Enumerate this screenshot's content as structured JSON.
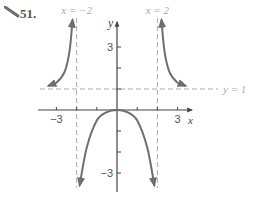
{
  "problem": {
    "number": "51."
  },
  "chart_data": {
    "type": "line",
    "title": "",
    "xlabel": "x",
    "ylabel": "y",
    "xlim": [
      -3.5,
      3.5
    ],
    "ylim": [
      -3.8,
      4.5
    ],
    "x_tick_labels": [
      {
        "value": -3,
        "label": "−3"
      },
      {
        "value": 3,
        "label": "3"
      }
    ],
    "y_tick_labels": [
      {
        "value": 3,
        "label": "3"
      },
      {
        "value": -3,
        "label": "−3"
      }
    ],
    "x_ticks": [
      -3,
      -2,
      -1,
      1,
      2,
      3
    ],
    "y_ticks": [
      -3,
      -2,
      -1,
      1,
      2,
      3
    ],
    "asymptotes": [
      {
        "type": "vertical",
        "value": -2,
        "label": "x = −2"
      },
      {
        "type": "vertical",
        "value": 2,
        "label": "x = 2"
      },
      {
        "type": "horizontal",
        "value": 1,
        "label": "y = 1"
      }
    ],
    "series": [
      {
        "name": "left-branch",
        "description": "above y=1, rising to +inf near x=-2 from left",
        "points": [
          [
            -3.4,
            1.15
          ],
          [
            -3,
            1.3
          ],
          [
            -2.6,
            1.8
          ],
          [
            -2.35,
            2.8
          ],
          [
            -2.2,
            4.3
          ]
        ]
      },
      {
        "name": "middle-branch",
        "description": "max at (0,0), falling to -inf near x=±2",
        "points": [
          [
            -1.85,
            -3.6
          ],
          [
            -1.5,
            -1.8
          ],
          [
            -1,
            -0.5
          ],
          [
            -0.5,
            -0.1
          ],
          [
            0,
            0
          ],
          [
            0.5,
            -0.1
          ],
          [
            1,
            -0.5
          ],
          [
            1.5,
            -1.8
          ],
          [
            1.85,
            -3.6
          ]
        ]
      },
      {
        "name": "right-branch",
        "description": "above y=1, rising to +inf near x=2 from right",
        "points": [
          [
            2.2,
            4.3
          ],
          [
            2.35,
            2.8
          ],
          [
            2.6,
            1.8
          ],
          [
            3,
            1.3
          ],
          [
            3.4,
            1.15
          ]
        ]
      }
    ]
  },
  "colors": {
    "curve": "#6e6e6e",
    "axis": "#444444",
    "asymptote": "#aaaaaa",
    "label": "#555555"
  }
}
